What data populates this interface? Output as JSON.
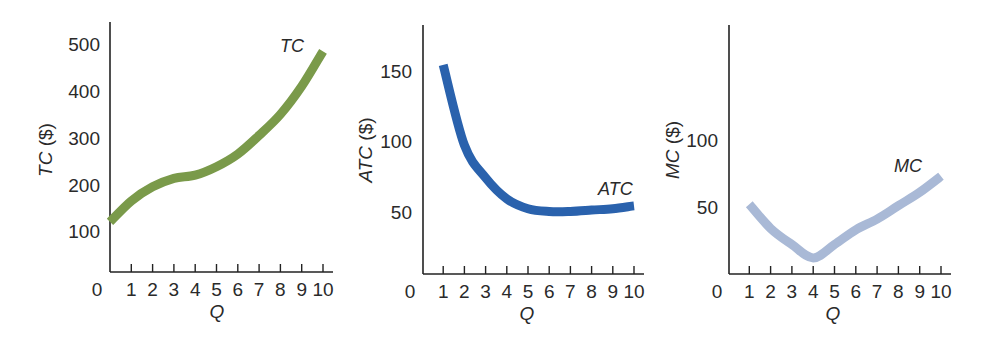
{
  "chart_data": [
    {
      "id": "tc",
      "type": "line",
      "title": "",
      "xlabel": "Q",
      "ylabel": "TC ($)",
      "ylabel_italic_part": "TC",
      "ylabel_unit_part": " ($)",
      "curve_label": "TC",
      "color": "#7a9a4a",
      "x": [
        0,
        1,
        2,
        3,
        4,
        5,
        6,
        7,
        8,
        9,
        10
      ],
      "values": [
        120,
        165,
        195,
        213,
        220,
        238,
        265,
        305,
        350,
        410,
        485
      ],
      "x_ticks": [
        1,
        2,
        3,
        4,
        5,
        6,
        7,
        8,
        9,
        10
      ],
      "y_ticks": [
        100,
        200,
        300,
        400,
        500
      ],
      "origin_label": "0",
      "xlim": [
        0,
        10
      ],
      "ylim": [
        0,
        540
      ],
      "grid": false,
      "legend": "none"
    },
    {
      "id": "atc",
      "type": "line",
      "title": "",
      "xlabel": "Q",
      "ylabel": "ATC ($)",
      "ylabel_italic_part": "ATC",
      "ylabel_unit_part": " ($)",
      "curve_label": "ATC",
      "color": "#2a62ad",
      "x": [
        1,
        2,
        3,
        4,
        5,
        6,
        7,
        8,
        9,
        10
      ],
      "values": [
        154,
        97,
        74,
        59,
        52,
        50,
        50,
        51,
        52,
        54
      ],
      "x_ticks": [
        1,
        2,
        3,
        4,
        5,
        6,
        7,
        8,
        9,
        10
      ],
      "y_ticks": [
        50,
        100,
        150
      ],
      "origin_label": "0",
      "xlim": [
        0,
        10
      ],
      "ylim": [
        0,
        180
      ],
      "grid": false,
      "legend": "none"
    },
    {
      "id": "mc",
      "type": "line",
      "title": "",
      "xlabel": "Q",
      "ylabel": "MC ($)",
      "ylabel_italic_part": "MC",
      "ylabel_unit_part": " ($)",
      "curve_label": "MC",
      "color": "#a9b9d6",
      "x": [
        1,
        2,
        3,
        4,
        5,
        6,
        7,
        8,
        9,
        10
      ],
      "values": [
        52,
        34,
        22,
        12,
        22,
        33,
        41,
        51,
        61,
        73
      ],
      "x_ticks": [
        1,
        2,
        3,
        4,
        5,
        6,
        7,
        8,
        9,
        10
      ],
      "y_ticks": [
        50,
        100
      ],
      "origin_label": "0",
      "xlim": [
        0,
        10
      ],
      "ylim": [
        0,
        185
      ],
      "grid": false,
      "legend": "none"
    }
  ]
}
